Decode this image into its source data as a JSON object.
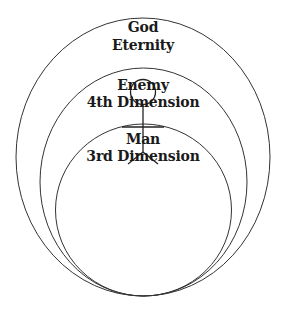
{
  "diagram": {
    "regions": [
      {
        "name": "God",
        "subtitle": "Eternity"
      },
      {
        "name": "Enemy",
        "subtitle": "4th Dimension"
      },
      {
        "name": "Man",
        "subtitle": "3rd Dimension"
      }
    ],
    "figure": "stick-figure",
    "colors": {
      "stroke": "#333333",
      "text": "#1a1a1a",
      "background": "#ffffff"
    }
  }
}
